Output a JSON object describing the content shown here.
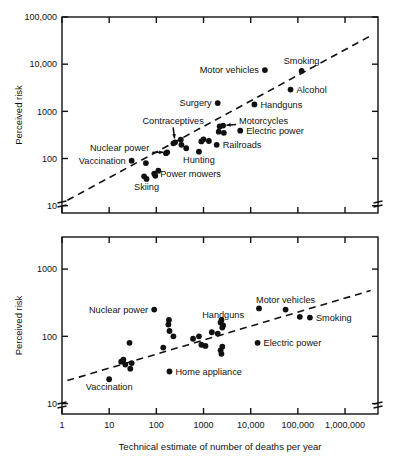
{
  "figure": {
    "background": "#ffffff",
    "ink": "#111111",
    "panels": [
      "top-panel",
      "bottom-panel"
    ]
  },
  "axis_titles": {
    "y": "Perceived risk",
    "x": "Technical estimate of number of deaths per year"
  },
  "chart_data": [
    {
      "id": "top-panel",
      "type": "scatter",
      "title": "",
      "xlabel": "",
      "ylabel": "Perceived risk",
      "xscale": "log",
      "yscale": "log",
      "xlim": [
        1,
        5000000
      ],
      "ylim": [
        7,
        100000
      ],
      "xticks": [
        1,
        10,
        100,
        1000,
        10000,
        100000,
        1000000
      ],
      "xticklabels": [
        "",
        "",
        "",
        "",
        "",
        "",
        ""
      ],
      "yticks": [
        10,
        100,
        1000,
        10000,
        100000
      ],
      "yticklabels": [
        "10",
        "100",
        "1000",
        "10,000",
        "100,000"
      ],
      "grid": false,
      "legend": "none",
      "axis_break_y": true,
      "axis_break_x": true,
      "trendline": {
        "style": "dashed",
        "x": [
          1.3,
          3500000
        ],
        "y": [
          13,
          40000
        ]
      },
      "points": [
        {
          "label": "Vaccination",
          "x": 30,
          "y": 90,
          "label_pos": "left"
        },
        {
          "label": "",
          "x": 60,
          "y": 80
        },
        {
          "label": "",
          "x": 55,
          "y": 42
        },
        {
          "label": "Skiing",
          "x": 62,
          "y": 37,
          "label_pos": "below"
        },
        {
          "label": "Power mowers",
          "x": 90,
          "y": 48,
          "label_pos": "right"
        },
        {
          "label": "",
          "x": 95,
          "y": 43
        },
        {
          "label": "",
          "x": 110,
          "y": 55
        },
        {
          "label": "",
          "x": 160,
          "y": 130
        },
        {
          "label": "Nuclear power",
          "x": 170,
          "y": 135,
          "label_pos": "left-arrow"
        },
        {
          "label": "",
          "x": 230,
          "y": 210
        },
        {
          "label": "Contraceptives",
          "x": 250,
          "y": 220,
          "label_pos": "above-arrow"
        },
        {
          "label": "",
          "x": 330,
          "y": 250
        },
        {
          "label": "",
          "x": 340,
          "y": 195
        },
        {
          "label": "",
          "x": 430,
          "y": 165
        },
        {
          "label": "Hunting",
          "x": 800,
          "y": 140,
          "label_pos": "below"
        },
        {
          "label": "",
          "x": 900,
          "y": 230
        },
        {
          "label": "",
          "x": 1000,
          "y": 255
        },
        {
          "label": "",
          "x": 1300,
          "y": 235
        },
        {
          "label": "Surgery",
          "x": 2000,
          "y": 1500,
          "label_pos": "left"
        },
        {
          "label": "Railroads",
          "x": 1900,
          "y": 195,
          "label_pos": "right"
        },
        {
          "label": "",
          "x": 2100,
          "y": 370
        },
        {
          "label": "",
          "x": 2200,
          "y": 480
        },
        {
          "label": "Motorcycles",
          "x": 2600,
          "y": 500,
          "label_pos": "right-arrow"
        },
        {
          "label": "",
          "x": 2700,
          "y": 350
        },
        {
          "label": "Electric power",
          "x": 6000,
          "y": 390,
          "label_pos": "right"
        },
        {
          "label": "Handguns",
          "x": 12000,
          "y": 1400,
          "label_pos": "right"
        },
        {
          "label": "Motor vehicles",
          "x": 20000,
          "y": 7500,
          "label_pos": "left"
        },
        {
          "label": "Alcohol",
          "x": 70000,
          "y": 2900,
          "label_pos": "right"
        },
        {
          "label": "Smoking",
          "x": 120000,
          "y": 7200,
          "label_pos": "above"
        }
      ]
    },
    {
      "id": "bottom-panel",
      "type": "scatter",
      "title": "",
      "xlabel": "Technical estimate of number of deaths per year",
      "ylabel": "Perceived risk",
      "xscale": "log",
      "yscale": "log",
      "xlim": [
        1,
        5000000
      ],
      "ylim": [
        7,
        3000
      ],
      "xticks": [
        1,
        10,
        100,
        1000,
        10000,
        100000,
        1000000
      ],
      "xticklabels": [
        "1",
        "10",
        "100",
        "1000",
        "10,000",
        "100,000",
        "1,000,000"
      ],
      "yticks": [
        10,
        100,
        1000
      ],
      "yticklabels": [
        "10",
        "100",
        "1000"
      ],
      "grid": false,
      "legend": "none",
      "axis_break_y": true,
      "axis_break_x": true,
      "trendline": {
        "style": "dashed",
        "x": [
          1.3,
          3500000
        ],
        "y": [
          22,
          480
        ]
      },
      "points": [
        {
          "label": "Vaccination",
          "x": 10,
          "y": 23,
          "label_pos": "below"
        },
        {
          "label": "",
          "x": 18,
          "y": 42
        },
        {
          "label": "",
          "x": 20,
          "y": 45
        },
        {
          "label": "",
          "x": 22,
          "y": 38
        },
        {
          "label": "",
          "x": 27,
          "y": 80
        },
        {
          "label": "",
          "x": 28,
          "y": 33
        },
        {
          "label": "",
          "x": 30,
          "y": 40
        },
        {
          "label": "Nuclear power",
          "x": 90,
          "y": 250,
          "label_pos": "left"
        },
        {
          "label": "",
          "x": 140,
          "y": 68
        },
        {
          "label": "",
          "x": 180,
          "y": 150
        },
        {
          "label": "",
          "x": 185,
          "y": 175
        },
        {
          "label": "",
          "x": 190,
          "y": 120
        },
        {
          "label": "Home appliance",
          "x": 190,
          "y": 30,
          "label_pos": "right"
        },
        {
          "label": "",
          "x": 230,
          "y": 100
        },
        {
          "label": "",
          "x": 600,
          "y": 92
        },
        {
          "label": "",
          "x": 800,
          "y": 100
        },
        {
          "label": "",
          "x": 900,
          "y": 75
        },
        {
          "label": "",
          "x": 1100,
          "y": 72
        },
        {
          "label": "",
          "x": 1500,
          "y": 115
        },
        {
          "label": "",
          "x": 2000,
          "y": 110
        },
        {
          "label": "",
          "x": 2300,
          "y": 160
        },
        {
          "label": "",
          "x": 2400,
          "y": 175
        },
        {
          "label": "",
          "x": 2500,
          "y": 135
        },
        {
          "label": "Handguns",
          "x": 2600,
          "y": 145,
          "label_pos": "above"
        },
        {
          "label": "",
          "x": 2300,
          "y": 62
        },
        {
          "label": "",
          "x": 2400,
          "y": 55
        },
        {
          "label": "",
          "x": 2500,
          "y": 70
        },
        {
          "label": "Electric power",
          "x": 14000,
          "y": 80,
          "label_pos": "right"
        },
        {
          "label": "",
          "x": 15000,
          "y": 260
        },
        {
          "label": "Motor vehicles",
          "x": 55000,
          "y": 250,
          "label_pos": "above"
        },
        {
          "label": "",
          "x": 110000,
          "y": 195
        },
        {
          "label": "Smoking",
          "x": 180000,
          "y": 190,
          "label_pos": "right"
        }
      ]
    }
  ]
}
